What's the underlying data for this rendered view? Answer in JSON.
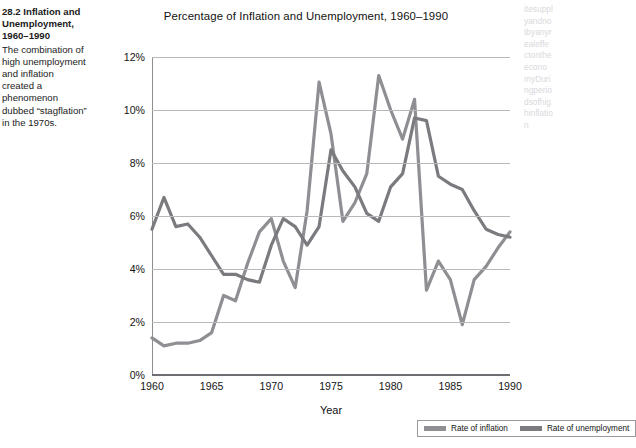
{
  "caption": {
    "figure_number": "28.2",
    "figure_title": "Inflation and Unemployment, 1960–1990",
    "body": "The combination of high unemployment and inflation created a phenomenon dubbed “stagflation” in the 1970s."
  },
  "colors": {
    "inflation": "#8e8e93",
    "unemployment": "#7a7a7f",
    "gridline": "#b9b9bd",
    "axis": "#6e6e73",
    "text": "#141414"
  },
  "legend": {
    "items": [
      {
        "label": "Rate of inflation",
        "color": "#8e8e93"
      },
      {
        "label": "Rate of unemployment",
        "color": "#7a7a7f"
      }
    ]
  },
  "chart_data": {
    "type": "line",
    "title": "Percentage of Inflation and Unemployment, 1960–1990",
    "xlabel": "Year",
    "ylabel": "",
    "xlim": [
      1960,
      1990
    ],
    "ylim": [
      0,
      12
    ],
    "grid": true,
    "legend_position": "bottom-right",
    "xticks": [
      1960,
      1965,
      1970,
      1975,
      1980,
      1985,
      1990
    ],
    "xticklabels": [
      "1960",
      "1965",
      "1970",
      "1975",
      "1980",
      "1985",
      "1990"
    ],
    "yticks": [
      0,
      2,
      4,
      6,
      8,
      10,
      12
    ],
    "yticklabels": [
      "0%",
      "2%",
      "4%",
      "6%",
      "8%",
      "10%",
      "12%"
    ],
    "x": [
      1960,
      1961,
      1962,
      1963,
      1964,
      1965,
      1966,
      1967,
      1968,
      1969,
      1970,
      1971,
      1972,
      1973,
      1974,
      1975,
      1976,
      1977,
      1978,
      1979,
      1980,
      1981,
      1982,
      1983,
      1984,
      1985,
      1986,
      1987,
      1988,
      1989,
      1990
    ],
    "series": [
      {
        "name": "Rate of inflation",
        "color": "#8e8e93",
        "values": [
          1.4,
          1.1,
          1.2,
          1.2,
          1.3,
          1.6,
          3.0,
          2.8,
          4.2,
          5.4,
          5.9,
          4.3,
          3.3,
          6.2,
          11.05,
          9.1,
          5.8,
          6.5,
          7.6,
          11.3,
          10.0,
          8.9,
          10.4,
          3.2,
          4.3,
          3.6,
          1.9,
          3.6,
          4.1,
          4.8,
          5.4
        ]
      },
      {
        "name": "Rate of unemployment",
        "color": "#7a7a7f",
        "values": [
          5.5,
          6.7,
          5.6,
          5.7,
          5.2,
          4.5,
          3.8,
          3.8,
          3.6,
          3.5,
          4.9,
          5.9,
          5.6,
          4.9,
          5.6,
          8.5,
          7.7,
          7.1,
          6.1,
          5.8,
          7.1,
          7.6,
          9.7,
          9.6,
          7.5,
          7.2,
          7.0,
          6.2,
          5.5,
          5.3,
          5.2
        ]
      }
    ]
  },
  "bleed_text": "itesupplyandnotbyanyrealeffectontheeconomyDuringperiodsofhighinflation"
}
